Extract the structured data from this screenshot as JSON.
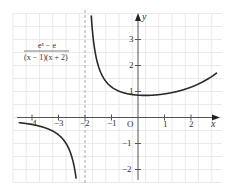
{
  "figure": {
    "formula": {
      "numerator": "eˣ − e",
      "denominator": "(x − 1)(x + 2)"
    },
    "axes": {
      "x_label": "x",
      "y_label": "y",
      "origin_label": "O",
      "x_ticks": [
        "−4",
        "−3",
        "−2",
        "−1",
        "1",
        "2"
      ],
      "y_ticks": [
        "3",
        "2",
        "1",
        "−1",
        "−2"
      ]
    },
    "colors": {
      "grid": "#e4e4e4",
      "axis": "#555555",
      "curve": "#2a2a2a",
      "asymptote": "#aaaaaa"
    }
  },
  "chart_data": {
    "type": "line",
    "title": "",
    "function": "y = (e^x − e) / ((x − 1)(x + 2))",
    "xlabel": "x",
    "ylabel": "y",
    "xlim": [
      -4.5,
      3.2
    ],
    "ylim": [
      -2.5,
      4.0
    ],
    "grid": true,
    "grid_step": 0.5,
    "vertical_asymptote": -2,
    "removable_point": {
      "x": 1,
      "y": 0.906
    },
    "series": [
      {
        "name": "left branch",
        "x": [
          -4.5,
          -4,
          -3.5,
          -3,
          -2.75,
          -2.5,
          -2.35,
          -2.25
        ],
        "values": [
          -0.13,
          -0.15,
          -0.19,
          -0.27,
          -0.36,
          -0.55,
          -0.85,
          -1.2
        ]
      },
      {
        "name": "right branch",
        "x": [
          -1.8,
          -1.6,
          -1.4,
          -1.2,
          -1,
          -0.5,
          0,
          0.5,
          1,
          1.5,
          2,
          2.5,
          2.9
        ],
        "values": [
          3.45,
          2.14,
          1.65,
          1.4,
          1.26,
          1.0,
          0.86,
          0.84,
          0.91,
          1.0,
          1.17,
          1.4,
          1.66
        ]
      }
    ]
  }
}
